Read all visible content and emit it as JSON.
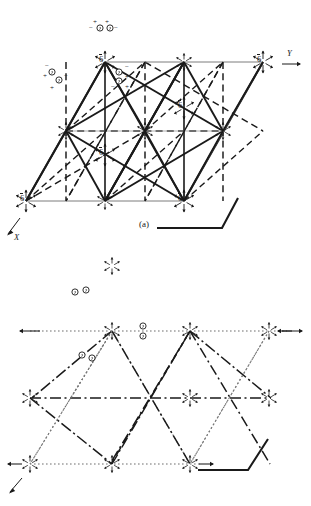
{
  "figure": {
    "title_a": "(a)",
    "title_b": "(b)",
    "scale_label_b": "1/4"
  },
  "axes": {
    "y_label": "Y",
    "x_label": "X"
  },
  "symbols": {
    "six_bar": "6",
    "overbar": true,
    "plus": "+",
    "minus": "−",
    "half_plus": "+",
    "half_minus": "−",
    "quarter_num": "1",
    "quarter_den": "4",
    "half_num": "1",
    "half_den": "2",
    "paren_open": "(",
    "paren_close": ")"
  },
  "panel_a": {
    "caption": "(a)",
    "axis_y": "Y",
    "axis_x": "X",
    "nodes": [
      {
        "id": "a-n-top",
        "label": "6",
        "bar": true,
        "x": 105,
        "y": 62
      },
      {
        "id": "a-n-right",
        "label": "6",
        "bar": true,
        "x": 263,
        "y": 62
      },
      {
        "id": "a-n-center",
        "label": "6",
        "bar": true,
        "x": 184,
        "y": 108
      },
      {
        "id": "a-n-midleft",
        "label": "6",
        "bar": true,
        "x": 105,
        "y": 155
      },
      {
        "id": "a-n-botleft",
        "label": "6",
        "bar": true,
        "x": 26,
        "y": 201
      },
      {
        "id": "a-n-botright",
        "label": "6",
        "bar": true,
        "x": 184,
        "y": 201
      }
    ],
    "point_groups": [
      {
        "id": "a-pg-top",
        "signs": [
          "−",
          "+",
          "+",
          "−"
        ]
      },
      {
        "id": "a-pg-left",
        "signs": [
          "−",
          "+",
          "+",
          "−"
        ]
      },
      {
        "id": "a-pg-mid",
        "signs": [
          "−",
          "+",
          "+",
          "−"
        ]
      }
    ]
  },
  "panel_b": {
    "caption": "(b)",
    "axis_y": "Y",
    "axis_x": "X",
    "scale": "1/4",
    "nodes": [
      {
        "id": "b-n-left",
        "label": "6",
        "bar": true,
        "sub": "1/4",
        "x": 112,
        "y": 385
      },
      {
        "id": "b-n-right",
        "label": "6",
        "bar": true,
        "sub": "1/4",
        "x": 269,
        "y": 385
      },
      {
        "id": "b-n-cellmid",
        "label": "6",
        "bar": true,
        "sub": "1/4",
        "x": 192,
        "y": 343
      },
      {
        "id": "b-n-cellleft",
        "label": "6",
        "bar": true,
        "sub": "1/4",
        "x": 112,
        "y": 390
      },
      {
        "id": "b-n-botleft",
        "label": "6",
        "bar": true,
        "sub": "",
        "x": 30,
        "y": 464
      },
      {
        "id": "b-n-botright",
        "label": "6",
        "bar": true,
        "sub": "1/4",
        "x": 190,
        "y": 464
      }
    ],
    "height_labels": [
      {
        "id": "b-h-1",
        "frac": "1/2",
        "sign": "−"
      },
      {
        "id": "b-h-2",
        "frac": "1/2",
        "sign": "+"
      },
      {
        "id": "b-h-3",
        "frac": "1/2",
        "sign": "+"
      },
      {
        "id": "b-h-4",
        "frac": "1/2",
        "sign": "+"
      },
      {
        "id": "b-h-5",
        "frac": "1/2",
        "sign": "−"
      },
      {
        "id": "b-h-6",
        "frac": "1/2",
        "sign": "+"
      },
      {
        "id": "b-h-7",
        "frac": "1/2",
        "sign": "+"
      }
    ]
  }
}
